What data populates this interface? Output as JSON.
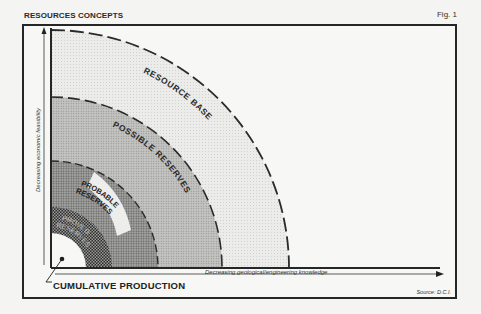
{
  "header": {
    "title": "RESOURCES CONCEPTS",
    "figure_label": "Fig. 1"
  },
  "axes": {
    "y_label": "Decreasing economic feasibility",
    "x_label": "Decreasing geological/engineering knowledge"
  },
  "regions": [
    {
      "name": "Resource Base",
      "label": "RESOURCE BASE",
      "fill": "#e6e6e4",
      "radius": 238
    },
    {
      "name": "Possible Reserves",
      "label": "POSSIBLE RESERVES",
      "fill": "#bdbdbb",
      "radius": 171
    },
    {
      "name": "Probable Reserves",
      "label_lines": [
        "PROBABLE",
        "RESERVES"
      ],
      "fill": "#8f8f8d",
      "radius": 107
    },
    {
      "name": "Proved Reserves",
      "label_lines": [
        "PROVED",
        "RESERVES"
      ],
      "fill": "#3d3d3d",
      "radius": 61
    },
    {
      "name": "Cumulative Production",
      "fill": "#f7f7f5",
      "radius": 35
    }
  ],
  "callout": {
    "label": "CUMULATIVE PRODUCTION"
  },
  "footer": {
    "source": "Source: D.C.I."
  },
  "colors": {
    "ink": "#1e1e1e",
    "paper": "#f4f4f2"
  }
}
